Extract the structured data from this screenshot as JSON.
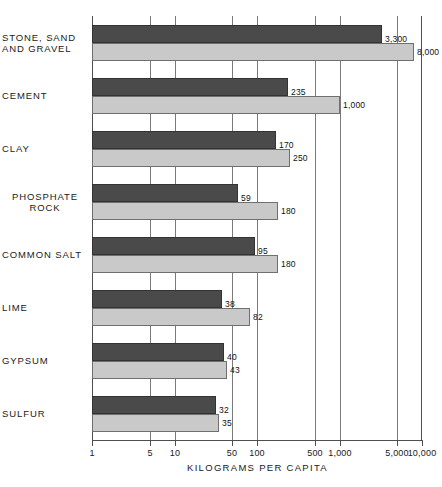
{
  "chart_data": {
    "type": "bar",
    "orientation": "horizontal",
    "title": "",
    "xlabel": "KILOGRAMS PER CAPITA",
    "ylabel": "",
    "xscale": "log",
    "xlim": [
      1,
      10000
    ],
    "grid": true,
    "legend_position": "none",
    "xticks": [
      1,
      5,
      10,
      50,
      100,
      500,
      1000,
      5000,
      10000
    ],
    "xtick_labels": [
      "1",
      "5",
      "10",
      "50",
      "100",
      "500",
      "1,000",
      "5,000",
      "10,000"
    ],
    "categories": [
      "STONE, SAND AND GRAVEL",
      "CEMENT",
      "CLAY",
      "PHOSPHATE ROCK",
      "COMMON SALT",
      "LIME",
      "GYPSUM",
      "SULFUR"
    ],
    "category_label_lines": [
      [
        "STONE, SAND",
        "AND GRAVEL"
      ],
      [
        "CEMENT"
      ],
      [
        "CLAY"
      ],
      [
        "PHOSPHATE",
        "ROCK"
      ],
      [
        "COMMON SALT"
      ],
      [
        "LIME"
      ],
      [
        "GYPSUM"
      ],
      [
        "SULFUR"
      ]
    ],
    "series": [
      {
        "name": "dark",
        "color": "#4a4a4a",
        "values": [
          3300,
          235,
          170,
          59,
          95,
          38,
          40,
          32
        ],
        "value_labels": [
          "3,300",
          "235",
          "170",
          "59",
          "95",
          "38",
          "40",
          "32"
        ]
      },
      {
        "name": "light",
        "color": "#c9c9c9",
        "values": [
          8000,
          1000,
          250,
          180,
          180,
          82,
          43,
          35
        ],
        "value_labels": [
          "8,000",
          "1,000",
          "250",
          "180",
          "180",
          "82",
          "43",
          "35"
        ]
      }
    ]
  },
  "colors": {
    "dark_bar": "#4a4a4a",
    "light_bar": "#c9c9c9",
    "axis": "#4f4f4f",
    "grid": "#7a7a7a",
    "text": "#1a1a1a",
    "background": "#ffffff"
  }
}
